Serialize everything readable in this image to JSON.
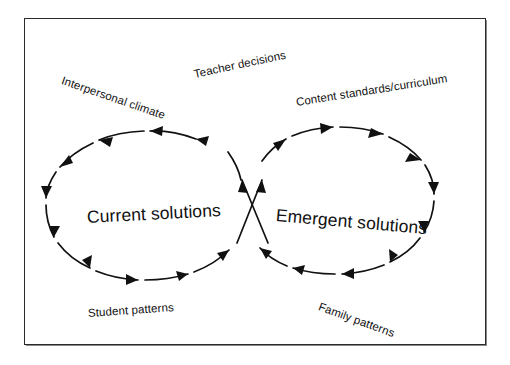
{
  "diagram": {
    "type": "cycle-loop",
    "frame": {
      "stroke_color": "#2a2a2a",
      "background": "#ffffff"
    },
    "line_color": "#111111",
    "nodes": [
      {
        "id": "current-solutions",
        "label": "Current solutions",
        "direction": "counter-clockwise",
        "rotation_deg": -3
      },
      {
        "id": "emergent-solutions",
        "label": "Emergent solutions",
        "direction": "clockwise",
        "rotation_deg": 5
      }
    ],
    "influences": [
      {
        "id": "interpersonal-climate",
        "label": "Interpersonal climate",
        "rotation_deg": 19
      },
      {
        "id": "teacher-decisions",
        "label": "Teacher decisions",
        "rotation_deg": -12
      },
      {
        "id": "content-standards",
        "label": "Content standards/curriculum",
        "rotation_deg": -9
      },
      {
        "id": "student-patterns",
        "label": "Student patterns",
        "rotation_deg": -4
      },
      {
        "id": "family-patterns",
        "label": "Family patterns",
        "rotation_deg": 20
      }
    ],
    "crossing": {
      "id": "center-crossing",
      "description": "Two arrows crossing in an X between the loops, both pointing upward"
    }
  }
}
